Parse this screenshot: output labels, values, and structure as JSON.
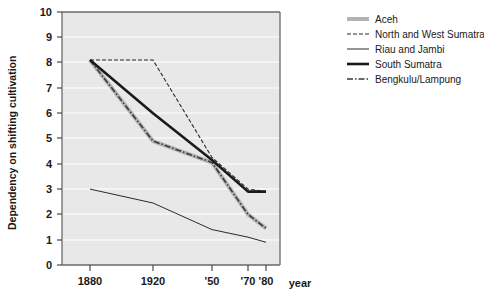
{
  "chart_data": {
    "type": "line",
    "title": "",
    "xlabel": "year",
    "ylabel": "Dependency on shifting cultivation",
    "x": [
      1880,
      1920,
      1950,
      1970,
      1980
    ],
    "xtick_labels": [
      "1880",
      "1920",
      "'50",
      "'70",
      "'80"
    ],
    "ytick_labels": [
      "0",
      "1",
      "2",
      "3",
      "4",
      "5",
      "6",
      "7",
      "8",
      "9",
      "10"
    ],
    "ylim": [
      0,
      10
    ],
    "xlim": [
      1865,
      1988
    ],
    "grid": "horizontal",
    "legend_position": "right",
    "plot_background": "#e8e8e8",
    "gridline_color": "#ffffff",
    "series": [
      {
        "name": "Aceh",
        "style": "thick-gray-solid",
        "color": "#b3b3b3",
        "width": 4,
        "values": [
          8.1,
          4.9,
          4.05,
          2.0,
          1.45
        ]
      },
      {
        "name": "North and West Sumatra",
        "style": "dashed",
        "color": "#2b2b2b",
        "width": 1.1,
        "dash": "4,2",
        "values": [
          8.1,
          8.1,
          4.25,
          3.0,
          2.9
        ]
      },
      {
        "name": "Riau and Jambi",
        "style": "thin-solid",
        "color": "#2b2b2b",
        "width": 1.0,
        "values": [
          3.0,
          2.45,
          1.4,
          1.1,
          0.9
        ]
      },
      {
        "name": "South Sumatra",
        "style": "thick-black-solid",
        "color": "#1a1a1a",
        "width": 2.6,
        "values": [
          8.1,
          6.0,
          4.15,
          2.9,
          2.9
        ]
      },
      {
        "name": "Bengkulu/Lampung",
        "style": "dash-dot",
        "color": "#3a3a3a",
        "width": 1.6,
        "dash": "6,2,1.5,2",
        "values": [
          8.1,
          4.9,
          4.05,
          2.0,
          1.45
        ]
      }
    ]
  },
  "legend": {
    "items": [
      {
        "label": "Aceh"
      },
      {
        "label": "North and West Sumatra"
      },
      {
        "label": "Riau and Jambi"
      },
      {
        "label": "South Sumatra"
      },
      {
        "label": "Bengkulu/Lampung"
      }
    ]
  },
  "axes": {
    "y_title": "Dependency on shifting cultivation",
    "x_title": "year",
    "y_ticks": [
      "10",
      "9",
      "8",
      "7",
      "6",
      "5",
      "4",
      "3",
      "2",
      "1",
      "0"
    ],
    "x_ticks": [
      "1880",
      "1920",
      "'50",
      "'70",
      "'80"
    ]
  }
}
